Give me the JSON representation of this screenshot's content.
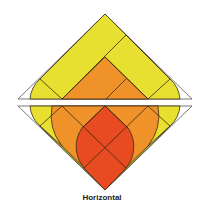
{
  "caption": "Horizontal",
  "colors": {
    "yellow": "#e8e030",
    "orange": "#f0922a",
    "red": "#e84a22",
    "stroke": "#3a2a10",
    "outline": "#555555"
  }
}
